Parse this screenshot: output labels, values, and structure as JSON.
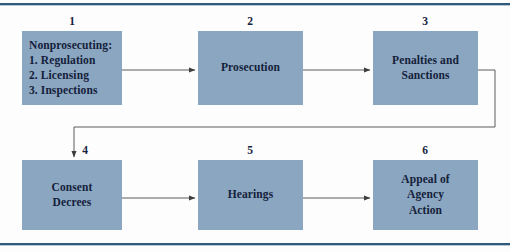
{
  "figure": {
    "background_color": "#fdfdfe",
    "rule_color": "#2f5a7e",
    "node_fill": "#8ba6c1",
    "node_text_color": "#14213a",
    "connector_color": "#4a4a4a"
  },
  "nodes": [
    {
      "number": "1",
      "label": "Nonprosecuting:\n1. Regulation\n2. Licensing\n3. Inspections",
      "align": "left"
    },
    {
      "number": "2",
      "label": "Prosecution",
      "align": "center"
    },
    {
      "number": "3",
      "label": "Penalties and\nSanctions",
      "align": "center"
    },
    {
      "number": "4",
      "label": "Consent\nDecrees",
      "align": "center"
    },
    {
      "number": "5",
      "label": "Hearings",
      "align": "center"
    },
    {
      "number": "6",
      "label": "Appeal of\nAgency\nAction",
      "align": "center"
    }
  ],
  "connectors": [
    {
      "name": "arrow-1-to-2"
    },
    {
      "name": "arrow-2-to-3"
    },
    {
      "name": "arrow-3-to-4-elbow"
    },
    {
      "name": "arrow-4-to-5"
    },
    {
      "name": "arrow-5-to-6"
    }
  ]
}
